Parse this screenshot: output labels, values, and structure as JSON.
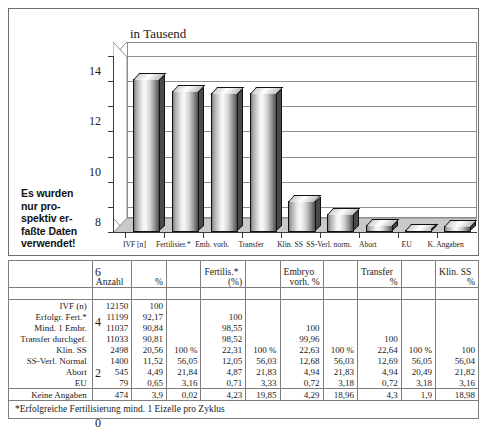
{
  "chart_data": {
    "type": "bar",
    "title": "in Tausend",
    "xlabel": "",
    "ylabel": "in Tausend",
    "ylim": [
      0,
      14
    ],
    "yticks": [
      0,
      2,
      4,
      6,
      8,
      10,
      12,
      14
    ],
    "grid": true,
    "legend": "none",
    "categories": [
      "IVF [n]",
      "Fertilisier.*",
      "Emb. vorh.",
      "Transfer",
      "Klin. SS",
      "SS-Verl. norm.",
      "Abort",
      "EU",
      "K. Angaben"
    ],
    "values": [
      12.15,
      11.199,
      11.037,
      11.033,
      2.498,
      1.4,
      0.545,
      0.079,
      0.474
    ],
    "units": "Tausend"
  },
  "side_note": {
    "lines": [
      "Es wurden",
      "nur pro-",
      "spektiv er-",
      "faßte Daten",
      "verwendet!"
    ]
  },
  "table": {
    "headers": [
      "",
      "Anzahl",
      "%",
      "",
      "Fertilis.*\n(%)",
      "",
      "Embryo\nvorh. %",
      "",
      "Transfer\n%",
      "",
      "Klin. SS\n%"
    ],
    "header_cells": [
      {
        "text": "",
        "align": "left"
      },
      {
        "text": "Anzahl",
        "align": "left"
      },
      {
        "text": "%",
        "align": "right"
      },
      {
        "text": "",
        "align": "left"
      },
      {
        "text": "Fertilis.*",
        "sub": "(%)",
        "align": "left"
      },
      {
        "text": "",
        "align": "left"
      },
      {
        "text": "Embryo",
        "sub": "vorh. %",
        "align": "left"
      },
      {
        "text": "",
        "align": "left"
      },
      {
        "text": "Transfer",
        "sub": "%",
        "align": "left"
      },
      {
        "text": "",
        "align": "left"
      },
      {
        "text": "Klin. SS",
        "sub": "%",
        "align": "left"
      }
    ],
    "rows": [
      {
        "label": "IVF (n)",
        "cells": [
          "12150",
          "100",
          "",
          "",
          "",
          "",
          "",
          "",
          "",
          ""
        ]
      },
      {
        "label": "Erfolgr. Fert.*",
        "cells": [
          "11199",
          "92,17",
          "",
          "100",
          "",
          "",
          "",
          "",
          "",
          ""
        ]
      },
      {
        "label": "Mind. 1 Embr.",
        "cells": [
          "11037",
          "90,84",
          "",
          "98,55",
          "",
          "100",
          "",
          "",
          "",
          ""
        ]
      },
      {
        "label": "Transfer durchgef.",
        "cells": [
          "11033",
          "90,81",
          "",
          "98,52",
          "",
          "99,96",
          "",
          "100",
          "",
          ""
        ]
      },
      {
        "label": "Klin. SS",
        "cells": [
          "2498",
          "20,56",
          "100 %",
          "22,31",
          "100 %",
          "22,63",
          "100 %",
          "22,64",
          "100 %",
          "100"
        ],
        "bold_index": 7
      },
      {
        "label": "SS-Verl. Normal",
        "cells": [
          "1400",
          "11,52",
          "56,05",
          "12,05",
          "56,03",
          "12,68",
          "56,03",
          "12,69",
          "56,05",
          "56,04"
        ]
      },
      {
        "label": "Abort",
        "cells": [
          "545",
          "4,49",
          "21,84",
          "4,87",
          "21,83",
          "4,94",
          "21,83",
          "4,94",
          "20,49",
          "21,82"
        ]
      },
      {
        "label": "EU",
        "cells": [
          "79",
          "0,65",
          "3,16",
          "0,71",
          "3,33",
          "0,72",
          "3,18",
          "0,72",
          "3,18",
          "3,16"
        ]
      },
      {
        "label": "Keine Angaben",
        "cells": [
          "474",
          "3,9",
          "0,02",
          "4,23",
          "19,85",
          "4,29",
          "18,96",
          "4,3",
          "1,9",
          "18,98"
        ]
      }
    ],
    "footnote": "*Erfolgreiche Fertilisierung mind. 1 Eizelle pro Zyklus"
  }
}
